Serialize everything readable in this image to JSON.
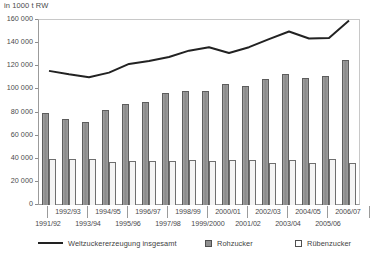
{
  "chart_data": {
    "type": "bar",
    "title": "",
    "unit_label": "in 1000 t RW",
    "xlabel": "",
    "ylabel": "",
    "ylim": [
      0,
      160000
    ],
    "ytick_step": 20000,
    "yticks": [
      "160 000",
      "140 000",
      "120 000",
      "100 000",
      "80 000",
      "60 000",
      "40 000",
      "20 000",
      "0"
    ],
    "ytick_values": [
      160000,
      140000,
      120000,
      100000,
      80000,
      60000,
      40000,
      20000,
      0
    ],
    "grid": false,
    "legend_position": "bottom",
    "categories": [
      "1991/92",
      "1992/93",
      "1993/94",
      "1994/95",
      "1995/96",
      "1996/97",
      "1997/98",
      "1998/99",
      "1999/2000",
      "2000/01",
      "2001/02",
      "2002/03",
      "2003/04",
      "2004/05",
      "2005/06",
      "2006/07"
    ],
    "x_labels_upper": [
      "1992/93",
      "1994/95",
      "1996/97",
      "1998/99",
      "2000/01",
      "2002/03",
      "2004/05",
      "2006/07"
    ],
    "x_labels_lower": [
      "1991/92",
      "1993/94",
      "1995/96",
      "1997/98",
      "1999/2000",
      "2001/02",
      "2003/04",
      "2005/06"
    ],
    "series": [
      {
        "name": "Weltzuckererzeugung insgesamt",
        "type": "line",
        "color": "#222222",
        "values": [
          116000,
          113000,
          110500,
          114500,
          122000,
          124500,
          128000,
          133500,
          136500,
          131500,
          136500,
          143500,
          150000,
          144000,
          144500,
          159500
        ]
      },
      {
        "name": "Rohzucker",
        "type": "bar",
        "color": "#909090",
        "values": [
          79500,
          74000,
          71500,
          82500,
          87500,
          89500,
          96500,
          99000,
          98500,
          104500,
          102500,
          109000,
          113000,
          110000,
          111500,
          125000
        ]
      },
      {
        "name": "Rübenzucker",
        "type": "bar",
        "color": "#f4f4f4",
        "values": [
          39500,
          39500,
          39500,
          37000,
          38000,
          38000,
          38000,
          39000,
          38000,
          38500,
          38500,
          36000,
          38500,
          36500,
          40000,
          36500
        ]
      }
    ]
  },
  "legend": {
    "items": [
      {
        "label": "Weltzuckererzeugung insgesamt",
        "marker": "line"
      },
      {
        "label": "Rohzucker",
        "marker": "filled-square"
      },
      {
        "label": "Rübenzucker",
        "marker": "empty-square"
      }
    ]
  }
}
